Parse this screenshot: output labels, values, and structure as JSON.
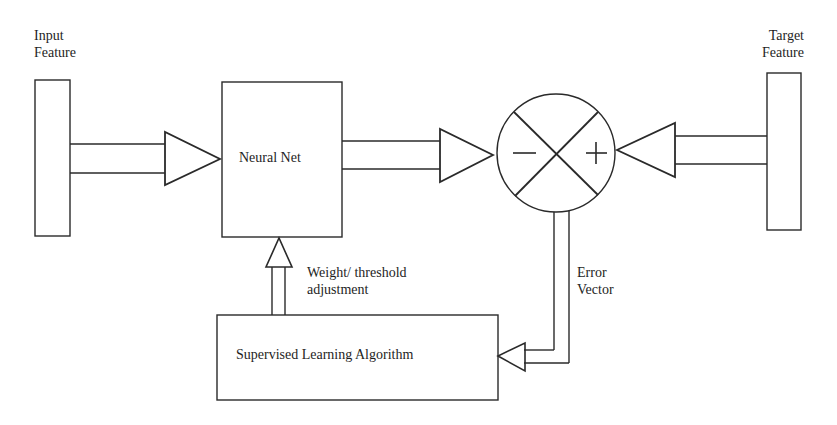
{
  "diagram": {
    "type": "supervised-learning-block-diagram",
    "input": {
      "label_line1": "Input",
      "label_line2": "Feature"
    },
    "target": {
      "label_line1": "Target",
      "label_line2": "Feature"
    },
    "neural_net": {
      "label": "Neural Net"
    },
    "comparator": {
      "minus_sign": "−",
      "plus_sign": "+"
    },
    "feedback": {
      "label_line1": "Weight/ threshold",
      "label_line2": "adjustment"
    },
    "error": {
      "label_line1": "Error",
      "label_line2": "Vector"
    },
    "algorithm": {
      "label": "Supervised Learning Algorithm"
    },
    "colors": {
      "stroke": "#2a2a2a",
      "background": "#ffffff"
    }
  }
}
